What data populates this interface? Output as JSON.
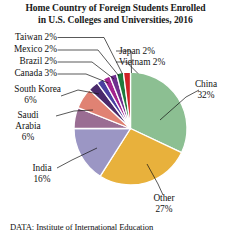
{
  "title": {
    "line1": "Home Country of Foreign Students Enrolled",
    "line2": "in U.S. Colleges and Universities, 2016"
  },
  "source": "DATA: Institute of International Education",
  "chart_data": {
    "type": "pie",
    "title": "Home Country of Foreign Students Enrolled in U.S. Colleges and Universities, 2016",
    "subtitle": "",
    "xlabel": "",
    "ylabel": "",
    "legend_position": "none",
    "grid": false,
    "units": "percent",
    "start_angle_deg": 0,
    "direction": "clockwise",
    "categories": [
      "China",
      "Other",
      "India",
      "Saudi Arabia",
      "South Korea",
      "Canada",
      "Brazil",
      "Mexico",
      "Taiwan",
      "Japan",
      "Vietnam"
    ],
    "values": [
      32,
      27,
      16,
      6,
      6,
      3,
      2,
      2,
      2,
      2,
      2
    ],
    "colors": [
      "#8cbf92",
      "#e8b13c",
      "#9b96c4",
      "#9a6d93",
      "#e08273",
      "#4a2a6b",
      "#4b3fa0",
      "#a3238e",
      "#6f2f8e",
      "#1f7a3c",
      "#cf2127"
    ],
    "slices": [
      {
        "label": "China",
        "value": 32,
        "display": "China 32%",
        "color": "#8cbf92"
      },
      {
        "label": "Other",
        "value": 27,
        "display": "Other 27%",
        "color": "#e8b13c"
      },
      {
        "label": "India",
        "value": 16,
        "display": "India 16%",
        "color": "#9b96c4"
      },
      {
        "label": "Saudi Arabia",
        "value": 6,
        "display": "Saudi Arabia 6%",
        "color": "#9a6d93"
      },
      {
        "label": "South Korea",
        "value": 6,
        "display": "South Korea 6%",
        "color": "#e08273"
      },
      {
        "label": "Canada",
        "value": 3,
        "display": "Canada 3%",
        "color": "#4a2a6b"
      },
      {
        "label": "Brazil",
        "value": 2,
        "display": "Brazil 2%",
        "color": "#4b3fa0"
      },
      {
        "label": "Mexico",
        "value": 2,
        "display": "Mexico 2%",
        "color": "#a3238e"
      },
      {
        "label": "Taiwan",
        "value": 2,
        "display": "Taiwan 2%",
        "color": "#6f2f8e"
      },
      {
        "label": "Japan",
        "value": 2,
        "display": "Japan 2%",
        "color": "#1f7a3c"
      },
      {
        "label": "Vietnam",
        "value": 2,
        "display": "Vietnam 2%",
        "color": "#cf2127"
      }
    ]
  },
  "labels": {
    "taiwan": "Taiwan 2%",
    "mexico": "Mexico 2%",
    "brazil": "Brazil 2%",
    "canada": "Canada 3%",
    "south_korea_l1": "South Korea",
    "south_korea_l2": "6%",
    "saudi_l1": "Saudi",
    "saudi_l2": "Arabia",
    "saudi_l3": "6%",
    "india_l1": "India",
    "india_l2": "16%",
    "japan": "Japan 2%",
    "vietnam": "Vietnam 2%",
    "china_l1": "China",
    "china_l2": "32%",
    "other_l1": "Other",
    "other_l2": "27%"
  }
}
